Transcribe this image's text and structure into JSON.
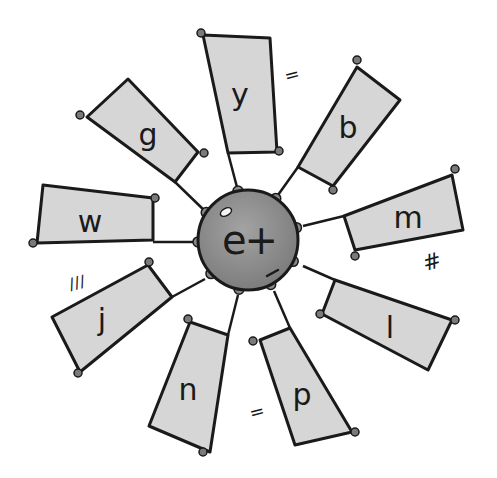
{
  "diagram": {
    "type": "word-wheel",
    "center": {
      "label": "et",
      "display": "e+",
      "fill": "#8f8f8f",
      "x": 248,
      "y": 240,
      "r": 50
    },
    "spoke_fill": "#d6d6d6",
    "line_color": "#1a1a1a",
    "dot_color": "#7a7a7a",
    "spokes": [
      {
        "letter": "y",
        "label_x": 240,
        "label_y": 95,
        "points": "203,35 270,38 277,152 228,153",
        "dots": [
          [
            201,
            33
          ],
          [
            279,
            151
          ]
        ],
        "line": [
          [
            228,
            153
          ],
          [
            238,
            191
          ]
        ]
      },
      {
        "letter": "b",
        "label_x": 348,
        "label_y": 128,
        "points": "357,67 400,100 333,186 298,167",
        "dots": [
          [
            357,
            60
          ],
          [
            333,
            190
          ]
        ],
        "line": [
          [
            298,
            167
          ],
          [
            278,
            195
          ]
        ]
      },
      {
        "letter": "m",
        "label_x": 408,
        "label_y": 218,
        "points": "452,175 463,230 355,250 344,216",
        "dots": [
          [
            455,
            169
          ],
          [
            355,
            256
          ]
        ],
        "line": [
          [
            344,
            216
          ],
          [
            303,
            226
          ]
        ]
      },
      {
        "letter": "l",
        "label_x": 390,
        "label_y": 328,
        "points": "335,280 452,320 428,370 322,314",
        "dots": [
          [
            320,
            314
          ],
          [
            455,
            320
          ]
        ],
        "line": [
          [
            335,
            280
          ],
          [
            303,
            266
          ]
        ]
      },
      {
        "letter": "p",
        "label_x": 302,
        "label_y": 395,
        "points": "260,340 290,328 352,432 295,445",
        "dots": [
          [
            253,
            341
          ],
          [
            355,
            432
          ]
        ],
        "line": [
          [
            290,
            328
          ],
          [
            274,
            291
          ]
        ]
      },
      {
        "letter": "n",
        "label_x": 188,
        "label_y": 390,
        "points": "190,322 228,335 210,452 149,426",
        "dots": [
          [
            188,
            319
          ],
          [
            203,
            452
          ]
        ],
        "line": [
          [
            228,
            335
          ],
          [
            238,
            295
          ]
        ]
      },
      {
        "letter": "j",
        "label_x": 102,
        "label_y": 320,
        "points": "52,317 148,265 172,297 80,372",
        "dots": [
          [
            149,
            262
          ],
          [
            78,
            373
          ]
        ],
        "line": [
          [
            172,
            297
          ],
          [
            205,
            279
          ]
        ]
      },
      {
        "letter": "w",
        "label_x": 90,
        "label_y": 222,
        "points": "43,185 153,198 153,240 37,243",
        "dots": [
          [
            155,
            198
          ],
          [
            33,
            243
          ]
        ],
        "line": [
          [
            153,
            242
          ],
          [
            196,
            242
          ]
        ]
      },
      {
        "letter": "g",
        "label_x": 148,
        "label_y": 135,
        "points": "128,79 198,152 175,182 87,117",
        "dots": [
          [
            80,
            115
          ],
          [
            204,
            153
          ]
        ],
        "line": [
          [
            175,
            182
          ],
          [
            207,
            213
          ]
        ]
      }
    ],
    "annotations": [
      {
        "text": "=",
        "x": 292,
        "y": 75,
        "size": 18
      },
      {
        "text": "#",
        "x": 432,
        "y": 262,
        "size": 22
      },
      {
        "text": "=",
        "x": 257,
        "y": 412,
        "size": 18
      },
      {
        "text": "///",
        "x": 77,
        "y": 283,
        "size": 16
      }
    ]
  }
}
